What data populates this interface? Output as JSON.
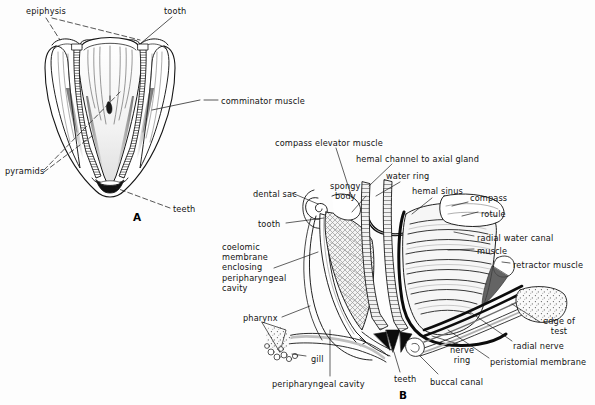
{
  "figure": {
    "panels": [
      {
        "id": "A",
        "letter": "A",
        "caption_position": {
          "x": 133,
          "y": 211
        },
        "labels": [
          {
            "name": "epiphysis",
            "text": "epiphysis",
            "x": 26,
            "y": 6
          },
          {
            "name": "tooth",
            "text": "tooth",
            "x": 164,
            "y": 6
          },
          {
            "name": "comminator-muscle",
            "text": "comminator muscle",
            "x": 221,
            "y": 96
          },
          {
            "name": "pyramids",
            "text": "pyramids",
            "x": 5,
            "y": 166
          },
          {
            "name": "teeth",
            "text": "teeth",
            "x": 173,
            "y": 204
          }
        ]
      },
      {
        "id": "B",
        "letter": "B",
        "caption_position": {
          "x": 399,
          "y": 389
        },
        "labels": [
          {
            "name": "compass-elevator-muscle",
            "text": "compass elevator muscle",
            "x": 275,
            "y": 138
          },
          {
            "name": "hemal-channel-to-axial-gland",
            "text": "hemal channel to axial gland",
            "x": 356,
            "y": 154
          },
          {
            "name": "water-ring",
            "text": "water ring",
            "x": 386,
            "y": 171
          },
          {
            "name": "spongy-body",
            "text": "spongy\nbody",
            "x": 330,
            "y": 181
          },
          {
            "name": "hemal-sinus",
            "text": "hemal sinus",
            "x": 412,
            "y": 186
          },
          {
            "name": "compass",
            "text": "compass",
            "x": 470,
            "y": 193
          },
          {
            "name": "dental-sac",
            "text": "dental sac",
            "x": 253,
            "y": 189
          },
          {
            "name": "rotule",
            "text": "rotule",
            "x": 481,
            "y": 209
          },
          {
            "name": "radial-water-canal",
            "text": "radial water canal",
            "x": 477,
            "y": 233
          },
          {
            "name": "tooth-b",
            "text": "tooth",
            "x": 258,
            "y": 219
          },
          {
            "name": "muscle",
            "text": "muscle",
            "x": 477,
            "y": 246
          },
          {
            "name": "coelomic-membrane-enclosing-peripharyngeal-cavity",
            "text": "coelomic\nmembrane\nenclosing\nperipharyngeal\ncavity",
            "x": 222,
            "y": 242
          },
          {
            "name": "retractor-muscle",
            "text": "retractor muscle",
            "x": 513,
            "y": 260
          },
          {
            "name": "pharynx",
            "text": "pharynx",
            "x": 243,
            "y": 313
          },
          {
            "name": "edge-of-test",
            "text": "edge of\ntest",
            "x": 543,
            "y": 316
          },
          {
            "name": "radial-nerve",
            "text": "radial nerve",
            "x": 513,
            "y": 341
          },
          {
            "name": "gill",
            "text": "gill",
            "x": 311,
            "y": 354
          },
          {
            "name": "nerve-ring",
            "text": "nerve\nring",
            "x": 450,
            "y": 345
          },
          {
            "name": "peristomial-membrane",
            "text": "peristomial membrane",
            "x": 490,
            "y": 357
          },
          {
            "name": "teeth-b",
            "text": "teeth",
            "x": 394,
            "y": 374
          },
          {
            "name": "peripharyngeal-cavity",
            "text": "peripharyngeal cavity",
            "x": 272,
            "y": 379
          },
          {
            "name": "buccal-canal",
            "text": "buccal canal",
            "x": 430,
            "y": 377
          }
        ]
      }
    ]
  },
  "style": {
    "ink": "#151515",
    "background": "#fdfdfd",
    "hatch": "#5a5a5a",
    "shade_light": "#bdbdbd",
    "shade_mid": "#8a8a8a",
    "shade_dark": "#3a3a3a"
  }
}
